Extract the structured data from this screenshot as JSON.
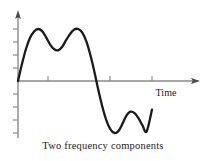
{
  "figure": {
    "caption": "Two frequency components",
    "axis": {
      "x_label": "Time",
      "x_axis_color": "#8a8a8a",
      "y_axis_color": "#8a8a8a",
      "tick_color": "#8a8a8a",
      "origin_x": 18,
      "origin_y": 81,
      "x_axis_end": 198,
      "y_axis_top": 12,
      "y_axis_bottom": 138,
      "x_ticks": [
        48,
        110,
        152
      ],
      "y_ticks_up": [
        68,
        55,
        42,
        29
      ],
      "y_ticks_down": [
        94,
        107,
        120,
        133
      ]
    },
    "curve": {
      "color": "#1a1a1a",
      "stroke_width": 2.3,
      "description": "Sum of a low-frequency sine and a higher-frequency sine: first half-cycle has two positive peaks separated by a dip, second half-cycle has two negative troughs separated by a bump."
    }
  },
  "chart_data": {
    "type": "line",
    "title": "Two frequency components",
    "xlabel": "Time",
    "ylabel": "",
    "grid": false,
    "legend": "none",
    "xlim": [
      0,
      1.0
    ],
    "ylim": [
      -1.15,
      1.15
    ],
    "annotations": [
      "Positive peak 1",
      "Mid dip (positive lobe)",
      "Positive peak 2",
      "Zero crossing (descending)",
      "Negative trough 1",
      "Mid bump (negative lobe)",
      "Negative trough 2",
      "Zero crossing (ascending)"
    ],
    "series": [
      {
        "name": "Two frequency components",
        "x": [
          0.0,
          0.03,
          0.06,
          0.09,
          0.12,
          0.15,
          0.18,
          0.21,
          0.24,
          0.27,
          0.3,
          0.33,
          0.36,
          0.39,
          0.42,
          0.45,
          0.48,
          0.51,
          0.54,
          0.57,
          0.6,
          0.63,
          0.66,
          0.69,
          0.72,
          0.75,
          0.78,
          0.81,
          0.84,
          0.87,
          0.9,
          0.93,
          0.96,
          1.0
        ],
        "y": [
          0.0,
          0.33,
          0.62,
          0.83,
          0.95,
          1.0,
          0.96,
          0.84,
          0.7,
          0.61,
          0.59,
          0.66,
          0.79,
          0.91,
          0.99,
          1.0,
          0.93,
          0.76,
          0.5,
          0.18,
          -0.18,
          -0.5,
          -0.76,
          -0.93,
          -1.0,
          -0.96,
          -0.82,
          -0.66,
          -0.59,
          -0.62,
          -0.72,
          -0.86,
          -0.97,
          -0.55
        ]
      }
    ],
    "key_points": {
      "peak_1": {
        "x": 0.15,
        "y": 1.0
      },
      "mid_dip": {
        "x": 0.3,
        "y": 0.59
      },
      "peak_2": {
        "x": 0.45,
        "y": 1.0
      },
      "zero_down": {
        "x": 0.6,
        "y": 0.0
      },
      "trough_1": {
        "x": 0.72,
        "y": -1.0
      },
      "mid_bump": {
        "x": 0.84,
        "y": -0.59
      },
      "trough_2": {
        "x": 0.93,
        "y": -0.97
      },
      "zero_up": {
        "x": 0.98,
        "y": 0.0
      }
    }
  }
}
